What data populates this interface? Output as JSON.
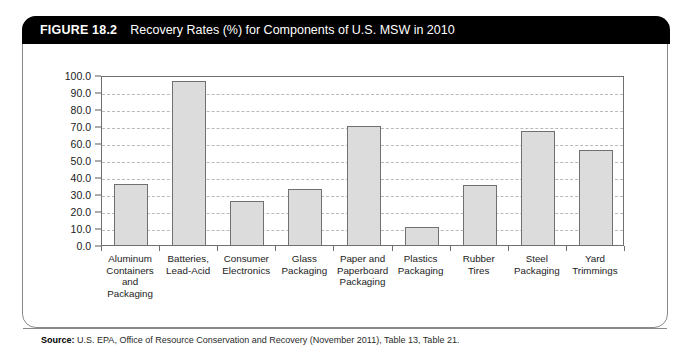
{
  "figure": {
    "label": "FIGURE 18.2",
    "title": "Recovery Rates (%) for Components of U.S. MSW in 2010",
    "source_label": "Source:",
    "source_text": "U.S. EPA, Office of Resource Conservation and Recovery (November 2011), Table 13, Table 21."
  },
  "chart_data": {
    "type": "bar",
    "title": "Recovery Rates (%) for Components of U.S. MSW in 2010",
    "xlabel": "",
    "ylabel": "",
    "ylim": [
      0,
      100
    ],
    "ytick_step": 10,
    "grid": true,
    "legend": "none",
    "bar_color": "#dcdcdc",
    "bar_border_color": "#707070",
    "ytick_labels": [
      "0.0",
      "10.0",
      "20.0",
      "30.0",
      "40.0",
      "50.0",
      "60.0",
      "70.0",
      "80.0",
      "90.0",
      "100.0"
    ],
    "yticks": [
      0,
      10,
      20,
      30,
      40,
      50,
      60,
      70,
      80,
      90,
      100
    ],
    "categories": [
      "Aluminum Containers and Packaging",
      "Batteries, Lead-Acid",
      "Consumer Electronics",
      "Glass Packaging",
      "Paper and Paperboard Packaging",
      "Plastics Packaging",
      "Rubber Tires",
      "Steel Packaging",
      "Yard Trimmings"
    ],
    "category_lines": [
      [
        "Aluminum",
        "Containers",
        "and",
        "Packaging"
      ],
      [
        "Batteries,",
        "Lead-Acid"
      ],
      [
        "Consumer",
        "Electronics"
      ],
      [
        "Glass",
        "Packaging"
      ],
      [
        "Paper and",
        "Paperboard",
        "Packaging"
      ],
      [
        "Plastics",
        "Packaging"
      ],
      [
        "Rubber",
        "Tires"
      ],
      [
        "Steel",
        "Packaging"
      ],
      [
        "Yard",
        "Trimmings"
      ]
    ],
    "values": [
      35.9,
      96.2,
      25.9,
      33.0,
      70.0,
      10.8,
      35.2,
      67.0,
      56.0
    ]
  }
}
